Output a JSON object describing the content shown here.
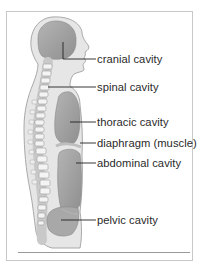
{
  "diagram": {
    "type": "anatomical-sagittal-section",
    "colors": {
      "body_fill": "#e6e6e6",
      "body_outline": "#a9a9a9",
      "cavity_fill": "#a6a6a6",
      "cavity_dark": "#8f8f8f",
      "vertebra_fill": "#f2f2f2",
      "leader_line": "#222222",
      "text": "#2a2a2a"
    },
    "labels": [
      {
        "id": "cranial",
        "text": "cranial cavity"
      },
      {
        "id": "spinal",
        "text": "spinal cavity"
      },
      {
        "id": "thoracic",
        "text": "thoracic cavity"
      },
      {
        "id": "diaphragm",
        "text": "diaphragm (muscle)"
      },
      {
        "id": "abdominal",
        "text": "abdominal cavity"
      },
      {
        "id": "pelvic",
        "text": "pelvic cavity"
      }
    ]
  }
}
